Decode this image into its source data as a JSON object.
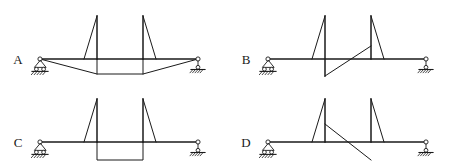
{
  "figure": {
    "background_color": "#ffffff",
    "line_color": "#1a1a1a",
    "width": 456,
    "height": 167
  },
  "panels": [
    {
      "id": "A",
      "label": "A",
      "label_x": 18,
      "label_y": 64,
      "beam": {
        "x1": 40,
        "y1": 59,
        "x2": 198,
        "y2": 59
      },
      "supports": {
        "left": {
          "type": "pin-support",
          "x": 40,
          "y": 59
        },
        "right": {
          "type": "roller-support",
          "x": 198,
          "y": 59
        }
      },
      "spikes": [
        {
          "x": 97,
          "top_y": 16,
          "base_y": 59,
          "slant_x": 84,
          "slant_side": "left"
        },
        {
          "x": 143,
          "top_y": 16,
          "base_y": 59,
          "slant_x": 156,
          "slant_side": "right"
        }
      ],
      "lower_shape": {
        "type": "trapezoid",
        "points": "40,59 97,74 143,74 198,59"
      },
      "drop_stems": [
        {
          "x": 97,
          "y1": 59,
          "y2": 74
        },
        {
          "x": 143,
          "y1": 59,
          "y2": 74
        }
      ]
    },
    {
      "id": "B",
      "label": "B",
      "label_x": 246,
      "label_y": 64,
      "beam": {
        "x1": 268,
        "y1": 59,
        "x2": 426,
        "y2": 59
      },
      "supports": {
        "left": {
          "type": "pin-support",
          "x": 268,
          "y": 59
        },
        "right": {
          "type": "roller-support",
          "x": 426,
          "y": 59
        }
      },
      "spikes": [
        {
          "x": 325,
          "top_y": 16,
          "base_y": 76,
          "slant_x": 312,
          "slant_side": "left"
        },
        {
          "x": 371,
          "top_y": 16,
          "base_y": 59,
          "slant_x": 384,
          "slant_side": "right"
        }
      ],
      "lower_shape": {
        "type": "diagonal",
        "points": "325,76 371,46"
      },
      "drop_stems": []
    },
    {
      "id": "C",
      "label": "C",
      "label_x": 18,
      "label_y": 147,
      "beam": {
        "x1": 40,
        "y1": 142,
        "x2": 198,
        "y2": 142
      },
      "supports": {
        "left": {
          "type": "pin-support",
          "x": 40,
          "y": 142
        },
        "right": {
          "type": "roller-support",
          "x": 198,
          "y": 142
        }
      },
      "spikes": [
        {
          "x": 97,
          "top_y": 99,
          "base_y": 142,
          "slant_x": 84,
          "slant_side": "left"
        },
        {
          "x": 143,
          "top_y": 99,
          "base_y": 142,
          "slant_x": 156,
          "slant_side": "right"
        }
      ],
      "lower_shape": {
        "type": "rectangle",
        "points": "97,142 97,160 143,160 143,142"
      },
      "drop_stems": []
    },
    {
      "id": "D",
      "label": "D",
      "label_x": 246,
      "label_y": 147,
      "beam": {
        "x1": 268,
        "y1": 142,
        "x2": 426,
        "y2": 142
      },
      "supports": {
        "left": {
          "type": "pin-support",
          "x": 268,
          "y": 142
        },
        "right": {
          "type": "roller-support",
          "x": 426,
          "y": 142
        }
      },
      "spikes": [
        {
          "x": 325,
          "top_y": 99,
          "base_y": 142,
          "slant_x": 312,
          "slant_side": "left"
        },
        {
          "x": 371,
          "top_y": 99,
          "base_y": 142,
          "slant_x": 384,
          "slant_side": "right"
        }
      ],
      "lower_shape": {
        "type": "diagonal",
        "points": "325,124 371,160"
      },
      "drop_stems": []
    }
  ],
  "chart_data": {
    "type": "line",
    "xlabel": "",
    "ylabel": "",
    "legend_position": "none",
    "grid": false,
    "series": [
      {
        "name": "A",
        "description": "Two upward spikes with outward slants; below the beam a trapezoid dips from both supports to a flat bottom between the two spike stations.",
        "x": [
          0,
          36,
          65,
          100
        ],
        "values": [
          0,
          -15,
          -15,
          0
        ]
      },
      {
        "name": "B",
        "description": "First spike extends both above and below the beam axis; a straight diagonal rises from the bottom of the first spike to mid-height of the second spike.",
        "x": [
          0,
          36,
          65,
          100
        ],
        "values": [
          0,
          -17,
          13,
          0
        ]
      },
      {
        "name": "C",
        "description": "Two upward spikes; below the beam a closed rectangle of constant depth spans between the two spike stations.",
        "x": [
          0,
          36,
          65,
          100
        ],
        "values": [
          0,
          -18,
          -18,
          0
        ]
      },
      {
        "name": "D",
        "description": "Two upward spikes; a straight diagonal falls from mid-height of the first spike, crosses the beam axis, and reaches below the beam at the second spike station.",
        "x": [
          0,
          36,
          65,
          100
        ],
        "values": [
          0,
          18,
          -18,
          0
        ]
      }
    ]
  }
}
